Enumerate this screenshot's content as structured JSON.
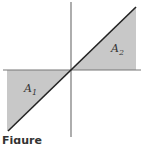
{
  "figure": {
    "labels": {
      "region1": "A",
      "region1_sub": "1",
      "region2": "A",
      "region2_sub": "2"
    },
    "caption": "Figure",
    "colors": {
      "shade": "#c8c8c8",
      "line": "#222222",
      "axis": "#777777",
      "background": "#ffffff"
    }
  },
  "diagram_data": {
    "type": "area-under-line",
    "line": "y = x",
    "regions": [
      {
        "name": "A1",
        "quadrant": "III",
        "between": "line and x-axis"
      },
      {
        "name": "A2",
        "quadrant": "I",
        "between": "line and x-axis"
      }
    ]
  }
}
